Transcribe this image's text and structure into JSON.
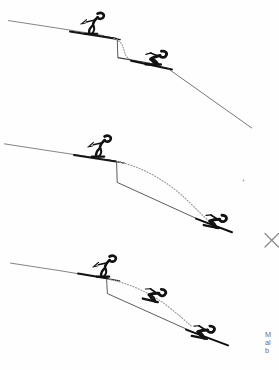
{
  "figure": {
    "background_color": "#ffffff",
    "ink_color": "#111111",
    "line_color": "#3a3a3a",
    "faint_line_color": "#8d8d8d",
    "dotted_color": "#9a9a9a",
    "caption_color": "#6f6f6f",
    "panels": [
      {
        "id": "panel-1",
        "label": "a",
        "drop_height_label": "short drop",
        "skiers": [
          {
            "role": "take-off-skier",
            "pose": "upright-poling",
            "x": 88,
            "y": 30
          },
          {
            "role": "landing-skier",
            "pose": "tucked-landing",
            "x": 156,
            "y": 56
          }
        ],
        "trajectory": "short dotted arc over a small vertical step"
      },
      {
        "id": "panel-2",
        "label": "b",
        "drop_height_label": "medium drop",
        "skiers": [
          {
            "role": "take-off-skier",
            "pose": "upright-poling",
            "x": 95,
            "y": 148
          },
          {
            "role": "landing-skier",
            "pose": "tucked-landing",
            "x": 213,
            "y": 220
          }
        ],
        "trajectory": "long dotted arc clearing the landing slope"
      },
      {
        "id": "panel-3",
        "label": "c",
        "drop_height_label": "tall drop",
        "skiers": [
          {
            "role": "take-off-skier",
            "pose": "upright-poling",
            "x": 100,
            "y": 272
          },
          {
            "role": "airborne-skier",
            "pose": "tucked-flight",
            "x": 152,
            "y": 292
          },
          {
            "role": "landing-skier",
            "pose": "tucked-landing",
            "x": 201,
            "y": 329
          }
        ],
        "trajectory": "dotted arc with mid-air skier then landing"
      }
    ],
    "marks": [
      {
        "name": "x-mark",
        "glyph": "×",
        "x": 268,
        "y": 240
      },
      {
        "name": "speck",
        "x": 243,
        "y": 180
      }
    ],
    "caption": {
      "lines": [
        "M",
        "al",
        "b"
      ],
      "note": "caption text cropped at right page edge"
    }
  }
}
